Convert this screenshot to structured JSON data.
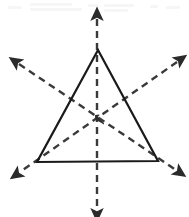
{
  "figure": {
    "caption": "",
    "background_color": "#ffffff",
    "width": 189,
    "height": 217
  },
  "shape": {
    "name": "equilateral-triangle",
    "stroke_color": "#1a1a1a",
    "stroke_width": 2.2,
    "fill": "none",
    "vertices": [
      {
        "label": "apex",
        "x": 98,
        "y": 50
      },
      {
        "label": "bottom-right",
        "x": 158,
        "y": 161
      },
      {
        "label": "bottom-left",
        "x": 37,
        "y": 162
      }
    ],
    "centroid": {
      "x": 98,
      "y": 118
    }
  },
  "symmetry_axes": {
    "count": 3,
    "stroke_color": "#3a3a3a",
    "stroke_width": 2.4,
    "dash_pattern": "7 5",
    "arrowheads": "both-ends",
    "lines": [
      {
        "name": "vertical-axis",
        "angle_deg": 90,
        "x1": 97,
        "y1": 19,
        "x2": 97,
        "y2": 210
      },
      {
        "name": "upper-left-to-lower-right-axis",
        "angle_deg": 34,
        "x1": 19,
        "y1": 64,
        "x2": 176,
        "y2": 170
      },
      {
        "name": "upper-right-to-lower-left-axis",
        "angle_deg": 146,
        "x1": 177,
        "y1": 62,
        "x2": 20,
        "y2": 172
      }
    ]
  },
  "center_marker": {
    "name": "centroid-arrow-cluster",
    "visible": true,
    "x": 98,
    "y": 118
  },
  "scan_artifact": {
    "present": true,
    "description": "faint residual text band at top edge of scan",
    "color": "#6c6c6c",
    "marks": [
      {
        "x": 8,
        "y": 6,
        "w": 14
      },
      {
        "x": 30,
        "y": 3,
        "w": 42
      },
      {
        "x": 30,
        "y": 8,
        "w": 52
      },
      {
        "x": 88,
        "y": 4,
        "w": 10
      },
      {
        "x": 104,
        "y": 4,
        "w": 30
      },
      {
        "x": 104,
        "y": 9,
        "w": 24
      },
      {
        "x": 150,
        "y": 5,
        "w": 8
      },
      {
        "x": 166,
        "y": 6,
        "w": 14
      }
    ]
  }
}
